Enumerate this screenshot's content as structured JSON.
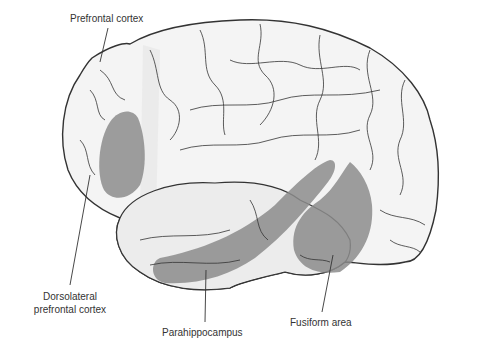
{
  "diagram": {
    "labels": {
      "prefrontal": "Prefrontal cortex",
      "dlpfc_line1": "Dorsolateral",
      "dlpfc_line2": "prefrontal cortex",
      "parahippocampus": "Parahippocampus",
      "fusiform": "Fusiform area"
    },
    "colors": {
      "brain_fill": "#f4f4f4",
      "outline": "#333333",
      "highlight_dark": "#8c8c8c",
      "highlight_light": "#e6e6e6",
      "label_text": "#333333"
    }
  }
}
